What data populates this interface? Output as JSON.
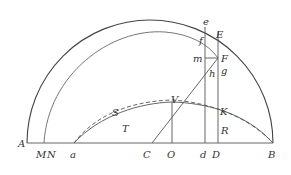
{
  "figure": {
    "type": "geometric-construction",
    "colors": {
      "stroke": "#555555",
      "label": "#333333",
      "background": "#ffffff"
    },
    "labels": {
      "A": "A",
      "M": "M",
      "N": "N",
      "a": "a",
      "C": "C",
      "O": "O",
      "d": "d",
      "D": "D",
      "B": "B",
      "S": "S",
      "T": "T",
      "V": "V",
      "K": "K",
      "R": "R",
      "e": "e",
      "E": "E",
      "f": "f",
      "m": "m",
      "F": "F",
      "g": "g",
      "h": "h"
    },
    "elements": [
      "outer semicircle from A to B centered at C",
      "inner arc from M through f to F",
      "baseline A-M-N-a-C-O-d-D-B",
      "vertical line from e to d",
      "vertical line from E to D",
      "vertical line from V to O",
      "line from C through V and h to F",
      "horizontal segment m-F",
      "solid curve a-T-V-K-B",
      "dashed curve a-S-V-R-B"
    ]
  }
}
